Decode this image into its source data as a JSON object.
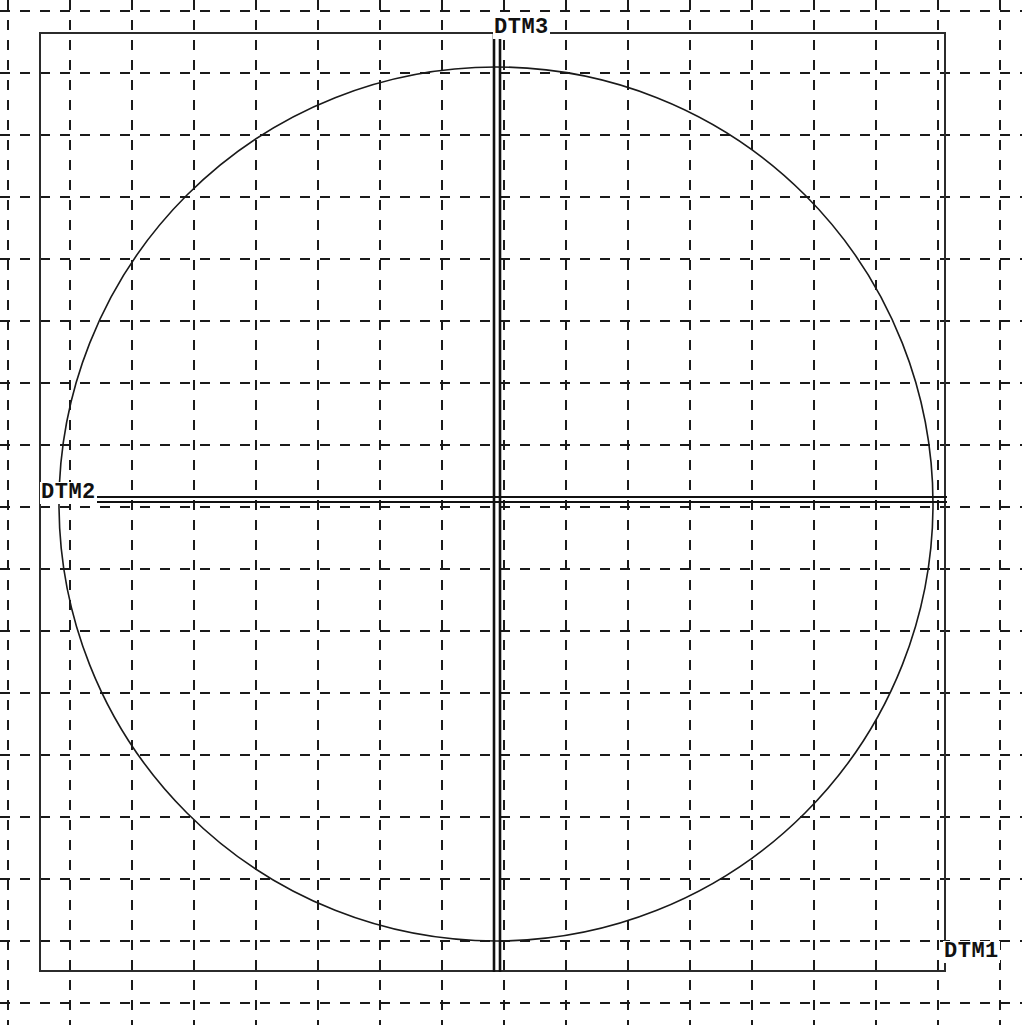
{
  "drawing": {
    "title": "Datum reference frame drawing",
    "background_color": "#ffffff",
    "line_color": "#1a1a1a",
    "grid_color": "#1a1a1a",
    "width": 1022,
    "height": 1025,
    "labels": {
      "dtm1": "DTM1",
      "dtm2": "DTM2",
      "dtm3": "DTM3"
    },
    "grid": {
      "style": "dashed",
      "spacing": 62,
      "origin_x": 8,
      "origin_y": 11,
      "vertical_count": 17,
      "horizontal_count": 17,
      "dash_pattern": "10 10",
      "line_width": 2
    },
    "rectangle": {
      "x": 40,
      "y": 33,
      "width": 905,
      "height": 938,
      "line_width": 2
    },
    "circle": {
      "center_x": 496,
      "center_y": 504,
      "radius": 437,
      "line_width": 1.6
    },
    "datum_vertical": {
      "name": "DTM3",
      "x": 497,
      "y_start": 33,
      "y_end": 972,
      "line_width": 2.6,
      "offset": 3
    },
    "datum_horizontal": {
      "name": "DTM2",
      "y": 497,
      "x_start": 92,
      "x_end": 947,
      "line_width": 2,
      "offset": 5
    }
  }
}
